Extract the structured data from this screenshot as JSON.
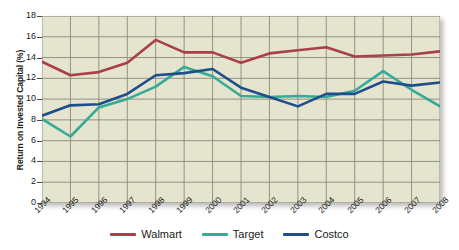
{
  "chart_data": {
    "type": "line",
    "title": "",
    "xlabel": "",
    "ylabel": "Return on Invested Capital (%)",
    "categories": [
      "1994",
      "1995",
      "1996",
      "1997",
      "1998",
      "1999",
      "2000",
      "2001",
      "2002",
      "2003",
      "2004",
      "2005",
      "2006",
      "2007",
      "2008"
    ],
    "ylim": [
      0,
      18
    ],
    "ytick_step": 2,
    "yticks": [
      "18",
      "16",
      "14",
      "12",
      "10",
      "8",
      "6",
      "4",
      "2",
      "0"
    ],
    "grid": true,
    "legend_position": "bottom",
    "plot_background": "#e5e4cf",
    "series": [
      {
        "name": "Walmart",
        "color": "#a83f4a",
        "values": [
          13.6,
          12.3,
          12.6,
          13.5,
          15.7,
          14.5,
          14.5,
          13.5,
          14.4,
          14.7,
          15.0,
          14.1,
          14.2,
          14.3,
          14.6
        ]
      },
      {
        "name": "Target",
        "color": "#34ab96",
        "values": [
          8.1,
          6.4,
          9.2,
          10.0,
          11.2,
          13.1,
          12.2,
          10.3,
          10.2,
          10.3,
          10.2,
          10.8,
          12.7,
          10.9,
          9.3
        ]
      },
      {
        "name": "Costco",
        "color": "#1f4e8c",
        "values": [
          8.4,
          9.4,
          9.5,
          10.5,
          12.3,
          12.5,
          12.9,
          11.1,
          10.2,
          9.3,
          10.5,
          10.5,
          11.7,
          11.3,
          11.6
        ]
      }
    ]
  },
  "legend": {
    "items": [
      {
        "label": "Walmart",
        "color": "#a83f4a"
      },
      {
        "label": "Target",
        "color": "#34ab96"
      },
      {
        "label": "Costco",
        "color": "#1f4e8c"
      }
    ]
  },
  "axes": {
    "y_title": "Return on Invested Capital (%)"
  }
}
